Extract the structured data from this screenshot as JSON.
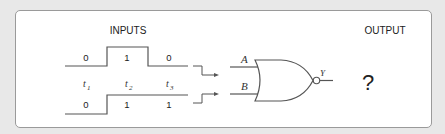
{
  "diagram": {
    "inputs_heading": "INPUTS",
    "output_heading": "OUTPUT",
    "gate_type": "NOR",
    "input_A_label": "A",
    "input_B_label": "B",
    "output_label": "Y",
    "output_value": "?",
    "time_labels": [
      {
        "base": "t",
        "sub": "1"
      },
      {
        "base": "t",
        "sub": "2"
      },
      {
        "base": "t",
        "sub": "3"
      }
    ],
    "waveform_A": [
      "0",
      "1",
      "0"
    ],
    "waveform_B": [
      "0",
      "1",
      "1"
    ],
    "colors": {
      "line": "#555555",
      "background": "#e8e8e8",
      "panel": "#ffffff"
    }
  }
}
